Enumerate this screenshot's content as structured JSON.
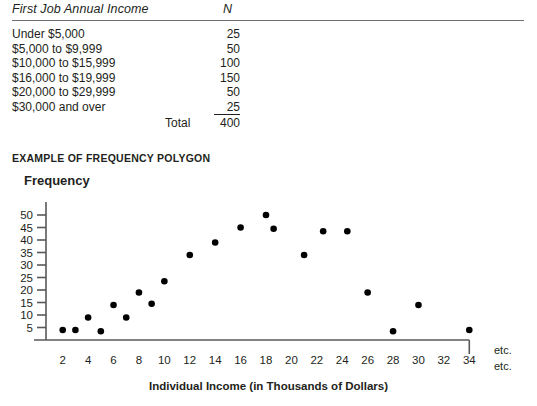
{
  "table": {
    "columns": [
      "First Job Annual Income",
      "N"
    ],
    "rows": [
      {
        "label": "Under $5,000",
        "n": "25"
      },
      {
        "label": "$5,000 to $9,999",
        "n": "50"
      },
      {
        "label": "$10,000 to $15,999",
        "n": "100"
      },
      {
        "label": "$16,000 to $19,999",
        "n": "150"
      },
      {
        "label": "$20,000 to $29,999",
        "n": "50"
      },
      {
        "label": "$30,000 and over",
        "n": "25"
      }
    ],
    "total_label": "Total",
    "total_value": "400"
  },
  "chart_caption": "EXAMPLE OF FREQUENCY POLYGON",
  "etc_upper": "etc.",
  "etc_lower": "etc.",
  "chart_data": {
    "type": "scatter",
    "title": "EXAMPLE OF FREQUENCY POLYGON",
    "xlabel": "Individual Income (in Thousands of Dollars)",
    "ylabel": "Frequency",
    "xlim": [
      1,
      35
    ],
    "ylim": [
      0,
      52
    ],
    "grid": false,
    "legend": null,
    "x_ticks": [
      2,
      4,
      6,
      8,
      10,
      12,
      14,
      16,
      18,
      20,
      22,
      24,
      26,
      28,
      30,
      32,
      34
    ],
    "x_tick_labels": [
      "2",
      "4",
      "6",
      "8",
      "10",
      "12",
      "14",
      "16",
      "18",
      "20",
      "22",
      "24",
      "26",
      "28",
      "30",
      "32",
      "34"
    ],
    "y_ticks": [
      5,
      10,
      15,
      20,
      25,
      30,
      35,
      40,
      45,
      50
    ],
    "y_tick_labels": [
      "5",
      "10",
      "15",
      "20",
      "25",
      "30",
      "35",
      "40",
      "45",
      "50"
    ],
    "points": [
      {
        "x": 2,
        "y": 4
      },
      {
        "x": 3,
        "y": 4
      },
      {
        "x": 4,
        "y": 9
      },
      {
        "x": 5,
        "y": 3.5
      },
      {
        "x": 6,
        "y": 14
      },
      {
        "x": 7,
        "y": 9
      },
      {
        "x": 8,
        "y": 19
      },
      {
        "x": 9,
        "y": 14.5
      },
      {
        "x": 10,
        "y": 23.5
      },
      {
        "x": 12,
        "y": 34
      },
      {
        "x": 14,
        "y": 39
      },
      {
        "x": 16,
        "y": 45
      },
      {
        "x": 18,
        "y": 50
      },
      {
        "x": 18.6,
        "y": 44.5
      },
      {
        "x": 21,
        "y": 34
      },
      {
        "x": 22.5,
        "y": 43.5
      },
      {
        "x": 24.4,
        "y": 43.5
      },
      {
        "x": 26,
        "y": 19
      },
      {
        "x": 28,
        "y": 3.5
      },
      {
        "x": 30,
        "y": 14
      },
      {
        "x": 34,
        "y": 4
      }
    ],
    "marker_color": "#000000",
    "axis_color": "#58595b"
  }
}
